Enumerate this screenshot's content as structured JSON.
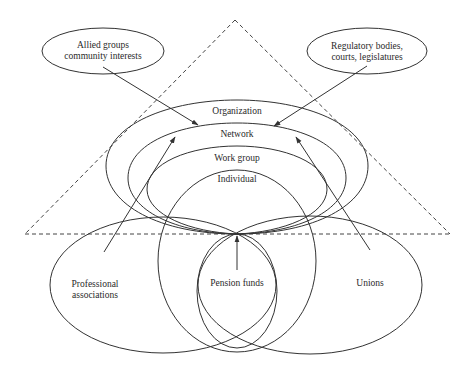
{
  "diagram": {
    "external_groups": {
      "allied": {
        "line1": "Allied groups",
        "line2": "community interests"
      },
      "regulatory": {
        "line1": "Regulatory bodies,",
        "line2": "courts, legislatures"
      }
    },
    "nested_levels": {
      "organization": "Organization",
      "network": "Network",
      "work_group": "Work group",
      "individual": "Individual"
    },
    "stakeholders": {
      "professional": {
        "line1": "Professional",
        "line2": "associations"
      },
      "pension": "Pension funds",
      "unions": "Unions"
    },
    "colors": {
      "stroke": "#333333",
      "background": "#ffffff"
    }
  }
}
